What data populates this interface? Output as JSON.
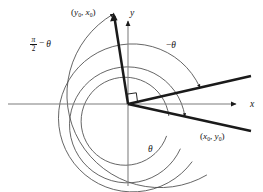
{
  "figure": {
    "background_color": "#ffffff",
    "ink_color": "#141414",
    "axis_color": "#8c8c8c",
    "arc_color": "#4f4f4f",
    "ray_color": "#1a1a1a"
  },
  "axes": {
    "x_label": "x",
    "y_label": "y",
    "origin": {
      "x": 128,
      "y": 104
    },
    "x_axis": {
      "x1": 8,
      "y1": 104,
      "x2": 243,
      "y2": 104,
      "arrow": "right"
    },
    "y_axis": {
      "x1": 128,
      "y1": 184,
      "x2": 128,
      "y2": 16,
      "arrow": "up"
    }
  },
  "labels": {
    "point_rotated": {
      "text": "(y0, x0)",
      "lead": "(",
      "var1": "y",
      "sub1": "0",
      "sep": ", ",
      "var2": "x",
      "sub2": "0",
      "tail": ")"
    },
    "point_original": {
      "text": "(x0, y0)",
      "lead": "(",
      "var1": "x",
      "sub1": "0",
      "sep": ", ",
      "var2": "y",
      "sub2": "0",
      "tail": ")"
    },
    "complement_angle": {
      "text": "pi/2 - theta",
      "numerator": "π",
      "denominator": "2",
      "operator": "−",
      "theta": "θ"
    },
    "negative_angle": {
      "text": "-theta",
      "operator": "−",
      "theta": "θ"
    },
    "positive_angle": {
      "text": "theta",
      "theta": "θ"
    }
  },
  "rays": [
    {
      "name": "ray-rotated-point",
      "description": "thick ray toward (y0, x0) in the second/first quadrant near vertical",
      "from": {
        "x": 128,
        "y": 104
      },
      "to": {
        "x": 114,
        "y": 14
      }
    },
    {
      "name": "ray-upper-right",
      "description": "thick ray into the first quadrant at a shallow positive slope",
      "from": {
        "x": 128,
        "y": 104
      },
      "to": {
        "x": 251,
        "y": 76
      }
    },
    {
      "name": "ray-original-point",
      "description": "thick ray toward (x0, y0) into the fourth quadrant",
      "from": {
        "x": 128,
        "y": 104
      },
      "to": {
        "x": 251,
        "y": 131
      }
    }
  ],
  "arcs": [
    {
      "name": "arc-outer",
      "radius": 91,
      "note": "outermost arc, arrowhead on ray-rotated-point"
    },
    {
      "name": "arc-second",
      "radius": 74,
      "note": "arrowhead on ray-upper-right"
    },
    {
      "name": "arc-third",
      "radius": 58,
      "note": "arrowhead on ray-original-point"
    },
    {
      "name": "arc-inner",
      "radius": 44,
      "note": "innermost arc, theta sweep"
    }
  ],
  "markers": {
    "right_angle": {
      "name": "right-angle-marker",
      "description": "small square indicating perpendicularity at the origin",
      "size": 9
    }
  }
}
